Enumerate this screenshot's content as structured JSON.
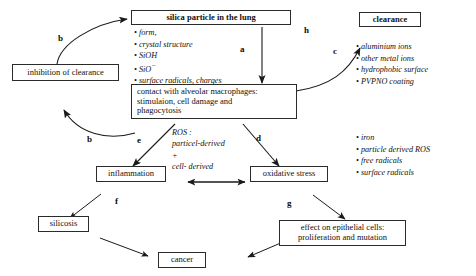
{
  "diagram": {
    "nodes": {
      "silica": "silica particle in the lung",
      "inhibition": "inhibition of clearance",
      "macrophages_line1": "contact with alveolar macrophages:",
      "macrophages_line2": "stimulaion, cell damage and",
      "macrophages_line3": "phagocytosis",
      "clearance": "clearance",
      "inflammation": "inflammation",
      "oxidative": "oxidative stress",
      "silicosis": "silicosis",
      "cancer": "cancer",
      "epithelial_line1": "effect on epithelial cells:",
      "epithelial_line2": "proliferation and mutation"
    },
    "particle_properties": [
      "form,",
      "crystal structure",
      "SiOH",
      "SiO",
      "surface radicals, charges"
    ],
    "clearance_factors": [
      "aluminium ions",
      "other metal ions",
      "hydrophobic surface",
      "PVPNO coating"
    ],
    "oxidative_factors": [
      "iron",
      "particle derived ROS",
      "free radicals",
      "surface radicals"
    ],
    "ros_note": {
      "line1": "ROS :",
      "line2": "particel-derived",
      "line3": "+",
      "line4": "cell- derived"
    },
    "edge_labels": {
      "a": "a",
      "b1": "b",
      "b2": "b",
      "c": "c",
      "d": "d",
      "e": "e",
      "f": "f",
      "g": "g",
      "h": "h"
    },
    "colors": {
      "stroke": "#2b2b2b",
      "text": "#111111",
      "background": "#ffffff"
    }
  }
}
